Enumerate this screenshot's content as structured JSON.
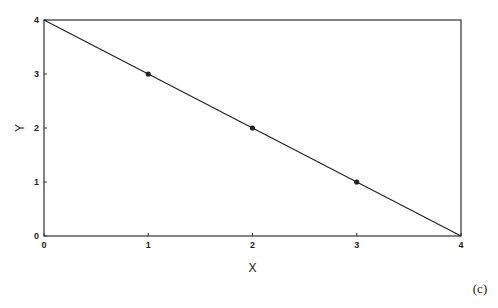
{
  "chart_data": {
    "type": "line",
    "title": "",
    "xlabel": "X",
    "ylabel": "Y",
    "xlim": [
      0,
      4
    ],
    "ylim": [
      0,
      4
    ],
    "x_ticks": [
      "0",
      "1",
      "2",
      "3",
      "4"
    ],
    "y_ticks": [
      "0",
      "1",
      "2",
      "3",
      "4"
    ],
    "grid": false,
    "series": [
      {
        "name": "line",
        "x": [
          0,
          1,
          2,
          3,
          4
        ],
        "y": [
          4,
          3,
          2,
          1,
          0
        ],
        "markers_at": [
          [
            1,
            3
          ],
          [
            2,
            2
          ],
          [
            3,
            1
          ]
        ]
      }
    ],
    "annotations": [
      "(c)"
    ],
    "colors": {
      "line": "#222222",
      "axis": "#333333"
    }
  },
  "labels": {
    "xlabel": "X",
    "ylabel": "Y",
    "panel": "(c)"
  }
}
